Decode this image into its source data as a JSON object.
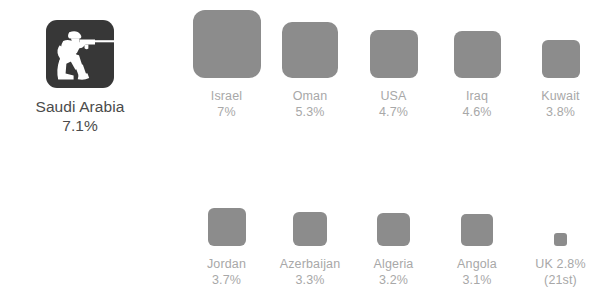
{
  "figure": {
    "accent_dark": "#373737",
    "square_color": "#8c8c8c",
    "caption_color": "#a8a8a8",
    "featured_text_color": "#4b4b4b",
    "background": "#ffffff"
  },
  "featured": {
    "icon": "soldier-with-rifle-icon",
    "label": "Saudi Arabia",
    "value": "7.1%"
  },
  "rows": [
    {
      "id": "row-1",
      "cells": [
        {
          "name": "Israel",
          "value": "7%",
          "size": 68
        },
        {
          "name": "Oman",
          "value": "5.3%",
          "size": 56
        },
        {
          "name": "USA",
          "value": "4.7%",
          "size": 48
        },
        {
          "name": "Iraq",
          "value": "4.6%",
          "size": 47
        },
        {
          "name": "Kuwait",
          "value": "3.8%",
          "size": 38
        }
      ]
    },
    {
      "id": "row-2",
      "cells": [
        {
          "name": "Jordan",
          "value": "3.7%",
          "size": 38
        },
        {
          "name": "Azerbaijan",
          "value": "3.3%",
          "size": 34
        },
        {
          "name": "Algeria",
          "value": "3.2%",
          "size": 33
        },
        {
          "name": "Angola",
          "value": "3.1%",
          "size": 32
        },
        {
          "name": "UK 2.8%",
          "value": "(21st)",
          "size": 13
        }
      ]
    }
  ],
  "chart_data": {
    "type": "bar",
    "title": "",
    "subtitle": "",
    "xlabel": "",
    "ylabel": "",
    "grid": false,
    "legend": false,
    "encoding": "square area proportional to value; squares bottom-aligned per row",
    "unit": "%",
    "categories": [
      "Saudi Arabia",
      "Israel",
      "Oman",
      "USA",
      "Iraq",
      "Kuwait",
      "Jordan",
      "Azerbaijan",
      "Algeria",
      "Angola",
      "UK"
    ],
    "values": [
      7.1,
      7,
      5.3,
      4.7,
      4.6,
      3.8,
      3.7,
      3.3,
      3.2,
      3.1,
      2.8
    ],
    "labels": [
      "7.1%",
      "7%",
      "5.3%",
      "4.7%",
      "4.6%",
      "3.8%",
      "3.7%",
      "3.3%",
      "3.2%",
      "3.1%",
      "2.8%"
    ],
    "annotations": [
      "UK (21st)"
    ],
    "ranks": [
      1,
      2,
      3,
      4,
      5,
      6,
      7,
      8,
      9,
      10,
      21
    ],
    "ylim": [
      0,
      7.1
    ]
  }
}
